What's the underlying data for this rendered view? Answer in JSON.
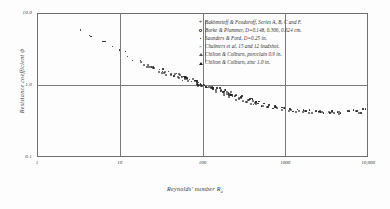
{
  "chart_data": {
    "type": "scatter",
    "title": "",
    "xlabel": "Reynolds' number Re",
    "ylabel": "Resistance coefficient ψ",
    "xscale": "log",
    "yscale": "log",
    "xlim": [
      1,
      10000
    ],
    "ylim": [
      0.1,
      10.0
    ],
    "xticks": [
      "1",
      "10",
      "100",
      "1000",
      "10,000"
    ],
    "xtick_values": [
      1,
      10,
      100,
      1000,
      10000
    ],
    "yticks": [
      "10.0",
      "1.0",
      "0.1"
    ],
    "ytick_values": [
      10.0,
      1.0,
      0.1
    ],
    "grid": true,
    "legend_position": "top-right",
    "series": [
      {
        "name": "Bakhmeteff & Feodoroff, Series A, B, C and F.",
        "marker": "plus",
        "points": [
          [
            3.1,
            6.2
          ],
          [
            3.6,
            5.6
          ],
          [
            4.2,
            5.1
          ],
          [
            4.9,
            4.6
          ],
          [
            5.7,
            4.2
          ],
          [
            6.6,
            3.8
          ],
          [
            7.7,
            3.4
          ],
          [
            9.0,
            3.1
          ],
          [
            10.5,
            2.8
          ],
          [
            12.2,
            2.5
          ],
          [
            14.0,
            2.3
          ],
          [
            16.5,
            2.1
          ]
        ]
      },
      {
        "name": "Burke & Plummer, D=0.148, 0.306, 0.624 cm.",
        "marker": "open-circle",
        "points": [
          [
            20,
            1.95
          ],
          [
            23,
            1.82
          ],
          [
            26,
            1.72
          ],
          [
            30,
            1.62
          ],
          [
            34,
            1.55
          ],
          [
            38,
            1.48
          ],
          [
            43,
            1.4
          ],
          [
            48,
            1.34
          ],
          [
            55,
            1.28
          ],
          [
            62,
            1.22
          ],
          [
            70,
            1.16
          ],
          [
            80,
            1.1
          ],
          [
            90,
            1.05
          ],
          [
            100,
            1.0
          ],
          [
            115,
            0.95
          ],
          [
            130,
            0.9
          ],
          [
            150,
            0.85
          ],
          [
            170,
            0.8
          ],
          [
            195,
            0.76
          ],
          [
            220,
            0.72
          ],
          [
            250,
            0.68
          ],
          [
            285,
            0.65
          ],
          [
            325,
            0.62
          ],
          [
            370,
            0.59
          ],
          [
            420,
            0.56
          ]
        ]
      },
      {
        "name": "Saunders & Ford, D=0.25 in.",
        "marker": "dot",
        "points": [
          [
            28,
            1.68
          ],
          [
            35,
            1.5
          ],
          [
            44,
            1.38
          ],
          [
            56,
            1.26
          ],
          [
            70,
            1.16
          ],
          [
            88,
            1.07
          ],
          [
            110,
            0.98
          ],
          [
            140,
            0.88
          ],
          [
            175,
            0.8
          ],
          [
            220,
            0.73
          ],
          [
            275,
            0.67
          ],
          [
            345,
            0.61
          ],
          [
            430,
            0.56
          ],
          [
            540,
            0.52
          ]
        ]
      },
      {
        "name": "Chalmers et al, 15 and 12 leadshot.",
        "marker": "x",
        "points": [
          [
            60,
            1.22
          ],
          [
            78,
            1.12
          ],
          [
            95,
            1.04
          ],
          [
            120,
            0.95
          ],
          [
            150,
            0.87
          ],
          [
            185,
            0.81
          ],
          [
            230,
            0.74
          ],
          [
            290,
            0.69
          ],
          [
            360,
            0.63
          ],
          [
            450,
            0.58
          ],
          [
            560,
            0.53
          ],
          [
            700,
            0.5
          ]
        ]
      },
      {
        "name": "Chilton & Colburn, porcelain 0.9 in.",
        "marker": "open-triangle",
        "points": [
          [
            600,
            0.52
          ],
          [
            720,
            0.49
          ],
          [
            880,
            0.47
          ],
          [
            1050,
            0.45
          ],
          [
            1300,
            0.44
          ],
          [
            1600,
            0.43
          ],
          [
            2000,
            0.42
          ],
          [
            2500,
            0.42
          ],
          [
            3100,
            0.41
          ],
          [
            3900,
            0.42
          ],
          [
            4900,
            0.41
          ],
          [
            6200,
            0.43
          ],
          [
            7800,
            0.42
          ]
        ]
      },
      {
        "name": "Chilton & Colburn, zinc 1.0 in.",
        "marker": "filled-triangle",
        "points": [
          [
            800,
            0.48
          ],
          [
            980,
            0.46
          ],
          [
            1200,
            0.45
          ],
          [
            1500,
            0.44
          ],
          [
            1900,
            0.43
          ],
          [
            2400,
            0.43
          ],
          [
            3000,
            0.42
          ],
          [
            3800,
            0.43
          ],
          [
            4800,
            0.42
          ],
          [
            6000,
            0.44
          ],
          [
            7500,
            0.43
          ],
          [
            9200,
            0.44
          ]
        ]
      }
    ]
  },
  "legend": {
    "items": [
      {
        "marker": "plus",
        "glyph": "+",
        "label": "Bakhmeteff & Feodoroff, Series A, B, C and F."
      },
      {
        "marker": "open-circle",
        "glyph": "○",
        "label": "Burke & Plummer, D=0.148, 0.306, 0.624 cm."
      },
      {
        "marker": "dot",
        "glyph": "•",
        "label": "Saunders & Ford, D=0.25 in."
      },
      {
        "marker": "x",
        "glyph": "×",
        "label": "Chalmers et al, 15 and 12 leadshot."
      },
      {
        "marker": "open-triangle",
        "glyph": "△",
        "label": "Chilton & Colburn, porcelain 0.9 in."
      },
      {
        "marker": "filled-triangle",
        "glyph": "▲",
        "label": "Chilton & Colburn, zinc 1.0 in."
      }
    ]
  },
  "axes": {
    "y_title": "Resistance coefficient ψ",
    "x_title_main": "Reynolds' number R",
    "x_title_sub": "e",
    "y_ticks": [
      {
        "value": 10.0,
        "label": "10.0"
      },
      {
        "value": 1.0,
        "label": "1.0"
      },
      {
        "value": 0.1,
        "label": "0.1"
      }
    ],
    "x_ticks": [
      {
        "value": 1,
        "label": "1"
      },
      {
        "value": 10,
        "label": "10"
      },
      {
        "value": 100,
        "label": "100"
      },
      {
        "value": 1000,
        "label": "1000"
      },
      {
        "value": 10000,
        "label": "10,000"
      }
    ]
  },
  "style": {
    "axis_color": "#6f6f6f",
    "grid_color": "#7a7a7a",
    "point_color": "#1d1d1d",
    "text_color": "#2d2d2d",
    "background": "#fdfdfd"
  }
}
